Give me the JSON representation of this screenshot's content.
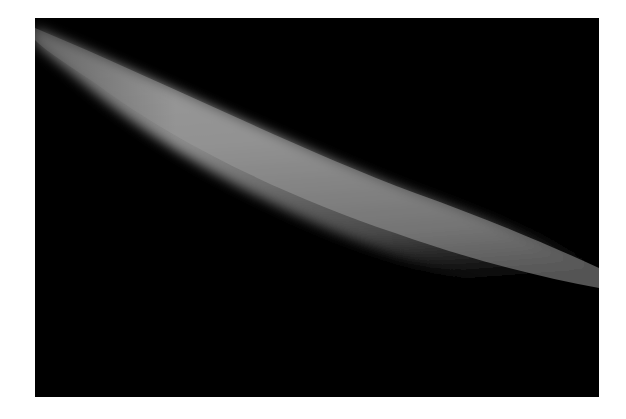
{
  "image": {
    "subject": "crescent-limb",
    "background_color": "#000000",
    "border_color": "#ffffff",
    "crescent_color_light": "#9a9a9a",
    "crescent_color_dark": "#2a2a2a"
  }
}
